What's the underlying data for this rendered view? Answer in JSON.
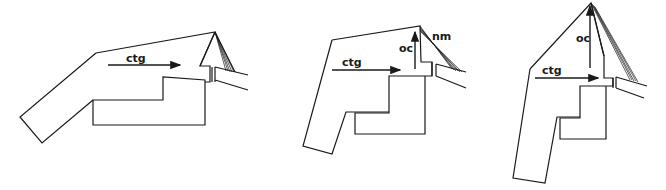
{
  "diagram": {
    "panels": [
      {
        "id": "panel-1",
        "labels": {
          "horizontal_arrow": "ctg"
        }
      },
      {
        "id": "panel-2",
        "labels": {
          "horizontal_arrow": "ctg",
          "vertical_arrow": "oc",
          "hatched": "nm"
        }
      },
      {
        "id": "panel-3",
        "labels": {
          "horizontal_arrow": "ctg",
          "vertical_arrow": "oc"
        }
      }
    ],
    "colors": {
      "line": "#1a1a1a",
      "background": "#ffffff"
    }
  }
}
